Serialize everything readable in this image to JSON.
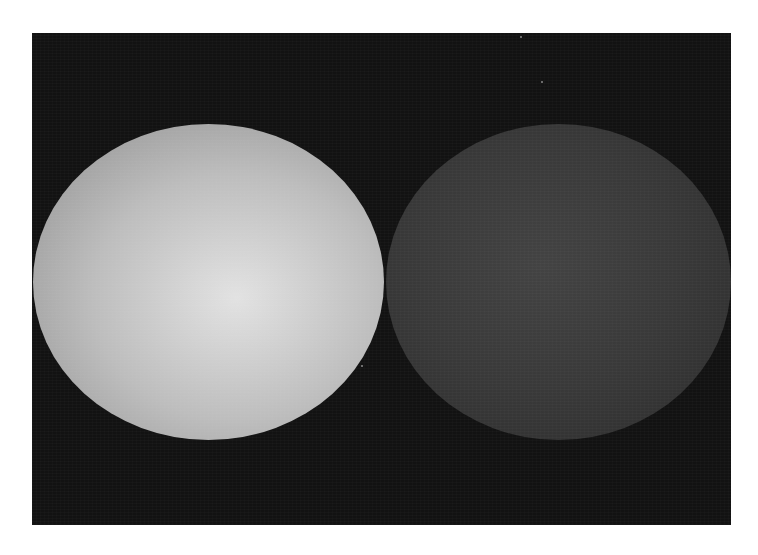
{
  "scene": {
    "description": "Two spheres on a dark background",
    "background_color": "#121212",
    "page_color": "#ffffff",
    "spheres": [
      {
        "name": "bright-sphere",
        "highlight_color": "#e2e2e2",
        "mid_color": "#bdbdbd",
        "edge_color": "#8c8c8c",
        "highlight_position": "58% 55%"
      },
      {
        "name": "dark-sphere",
        "highlight_color": "#434343",
        "mid_color": "#393939",
        "edge_color": "#2c2c2c",
        "highlight_position": "45% 45%"
      }
    ]
  }
}
